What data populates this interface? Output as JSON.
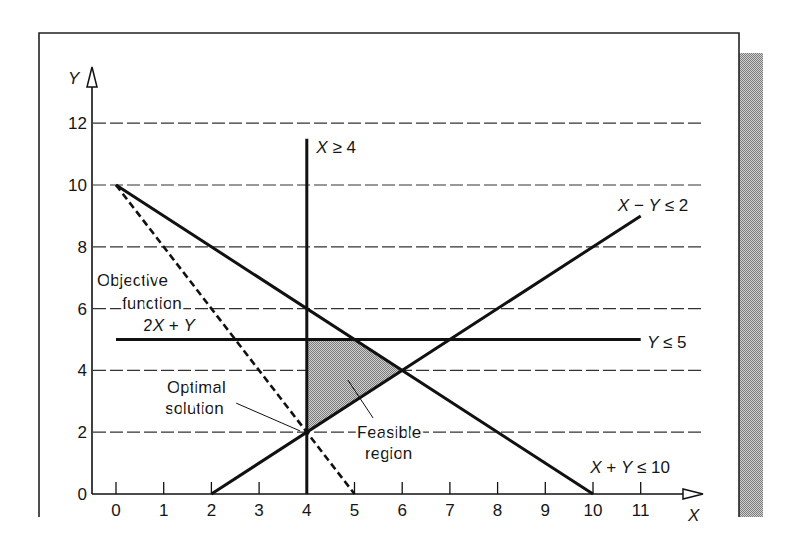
{
  "chart_data": {
    "type": "line",
    "title": "",
    "xlabel": "X",
    "ylabel": "Y",
    "xlim": [
      0,
      11
    ],
    "ylim": [
      0,
      12
    ],
    "x_ticks": [
      0,
      1,
      2,
      3,
      4,
      5,
      6,
      7,
      8,
      9,
      10,
      11
    ],
    "y_ticks": [
      0,
      2,
      4,
      6,
      8,
      10,
      12
    ],
    "grid": {
      "horizontal": true,
      "vertical": false,
      "style": "dashed",
      "y_values": [
        2,
        4,
        6,
        8,
        10,
        12
      ]
    },
    "legend": null,
    "series": [
      {
        "name": "X ≥ 4",
        "kind": "constraint",
        "style": "solid",
        "points": [
          [
            4,
            0
          ],
          [
            4,
            11.5
          ]
        ],
        "label_pos": [
          4.2,
          11.05
        ]
      },
      {
        "name": "Y ≤ 5",
        "kind": "constraint",
        "style": "solid",
        "points": [
          [
            0,
            5
          ],
          [
            11,
            5
          ]
        ],
        "label_pos": [
          11.13,
          4.72
        ]
      },
      {
        "name": "X − Y ≤ 2",
        "kind": "constraint",
        "style": "solid",
        "points": [
          [
            2,
            0
          ],
          [
            11,
            9
          ]
        ],
        "label_pos": [
          10.52,
          9.16
        ]
      },
      {
        "name": "X + Y ≤ 10",
        "kind": "constraint",
        "style": "solid",
        "points": [
          [
            0,
            10
          ],
          [
            10,
            0
          ]
        ],
        "label_pos": [
          9.94,
          0.68
        ]
      },
      {
        "name": "Objective function 2X + Y",
        "kind": "objective",
        "style": "dashed",
        "points": [
          [
            0,
            10
          ],
          [
            5,
            0
          ]
        ]
      }
    ],
    "feasible_region": {
      "label": "Feasible region",
      "vertices": [
        [
          4,
          2
        ],
        [
          4,
          5
        ],
        [
          5,
          5
        ],
        [
          6,
          4
        ]
      ]
    },
    "optimal_solution": {
      "label": "Optimal solution",
      "x": 4,
      "y": 2
    },
    "annotations": [
      {
        "id": "objective-label-line-1",
        "text": "Objective",
        "x": -0.4,
        "y": 6.73
      },
      {
        "id": "objective-label-line-2",
        "text": "function",
        "x": 0.13,
        "y": 5.99
      },
      {
        "id": "objective-label-line-3",
        "text": "2X + Y",
        "x": 0.57,
        "y": 5.27
      },
      {
        "id": "optimal-label-line-1",
        "text": "Optimal",
        "x": 1.07,
        "y": 3.27
      },
      {
        "id": "optimal-label-line-2",
        "text": "solution",
        "x": 1.03,
        "y": 2.59
      },
      {
        "id": "feasible-label-line-1",
        "text": "Feasible",
        "x": 5.05,
        "y": 1.81
      },
      {
        "id": "feasible-label-line-2",
        "text": "region",
        "x": 5.22,
        "y": 1.13
      }
    ],
    "leaders": [
      {
        "id": "optimal-leader",
        "from": [
          2.52,
          2.94
        ],
        "to": [
          3.86,
          2.04
        ]
      },
      {
        "id": "feasible-leader",
        "from": [
          4.86,
          3.69
        ],
        "to": [
          5.39,
          2.46
        ]
      }
    ],
    "colors": {
      "ink": "#111111",
      "grid": "#333333",
      "shade_dark": "#7a7a7a",
      "shade_light": "#d2d2d2"
    }
  }
}
